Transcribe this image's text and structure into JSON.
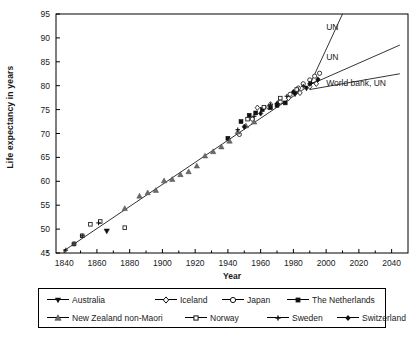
{
  "chart_data": {
    "type": "scatter",
    "title": "",
    "xlabel": "Year",
    "ylabel": "Life expectancy in years",
    "xlim": [
      1835,
      2050
    ],
    "ylim": [
      45,
      95
    ],
    "xticks": [
      1840,
      1860,
      1880,
      1900,
      1920,
      1940,
      1960,
      1980,
      2000,
      2020,
      2040
    ],
    "yticks": [
      45,
      50,
      55,
      60,
      65,
      70,
      75,
      80,
      85,
      90,
      95
    ],
    "grid": false,
    "legend_position": "below-axes",
    "trendline": {
      "label": "best-practice linear trend",
      "x": [
        1840,
        1996
      ],
      "y": [
        45.5,
        81.5
      ]
    },
    "annotations": [
      {
        "label": "UN",
        "x_text": 2000,
        "y_text": 92.2,
        "leader_from": [
          1990,
          80.2
        ],
        "leader_to": [
          2010,
          95.0
        ]
      },
      {
        "label": "UN",
        "x_text": 2000,
        "y_text": 86.0,
        "leader_from": [
          1990,
          80.2
        ],
        "leader_to": [
          2045,
          88.5
        ]
      },
      {
        "label": "World bank, UN",
        "x_text": 2000,
        "y_text": 80.5,
        "leader_from": [
          1990,
          79.2
        ],
        "leader_to": [
          2045,
          82.5
        ]
      }
    ],
    "series": [
      {
        "name": "Australia",
        "marker": "triangle-down",
        "fill": "#111111",
        "points": [
          [
            1866,
            49.6
          ],
          [
            1981,
            78.3
          ],
          [
            1988,
            79.5
          ]
        ]
      },
      {
        "name": "Iceland",
        "marker": "diamond-open",
        "fill": "#ffffff",
        "points": [
          [
            1958,
            75.4
          ],
          [
            1966,
            76.1
          ],
          [
            1971,
            76.5
          ],
          [
            1977,
            77.4
          ],
          [
            1984,
            78.5
          ],
          [
            1990,
            79.8
          ],
          [
            1994,
            80.4
          ]
        ]
      },
      {
        "name": "Japan",
        "marker": "circle-open",
        "fill": "#ffffff",
        "points": [
          [
            1947,
            69.8
          ],
          [
            1955,
            73.0
          ],
          [
            1965,
            75.5
          ],
          [
            1972,
            76.6
          ],
          [
            1978,
            78.2
          ],
          [
            1983,
            79.5
          ],
          [
            1986,
            80.4
          ],
          [
            1990,
            81.2
          ],
          [
            1993,
            82.0
          ],
          [
            1996,
            82.6
          ]
        ]
      },
      {
        "name": "The Netherlands",
        "marker": "square-filled",
        "fill": "#111111",
        "points": [
          [
            1940,
            69.0
          ],
          [
            1948,
            72.5
          ],
          [
            1953,
            73.8
          ],
          [
            1957,
            74.3
          ],
          [
            1961,
            75.0
          ],
          [
            1966,
            75.4
          ],
          [
            1970,
            75.9
          ],
          [
            1975,
            76.4
          ]
        ]
      },
      {
        "name": "New Zealand non-Maori",
        "marker": "triangle-up",
        "fill": "#6b6b6b",
        "points": [
          [
            1877,
            54.3
          ],
          [
            1886,
            56.9
          ],
          [
            1891,
            57.6
          ],
          [
            1896,
            58.1
          ],
          [
            1901,
            60.1
          ],
          [
            1906,
            60.4
          ],
          [
            1911,
            61.4
          ],
          [
            1916,
            62.0
          ],
          [
            1921,
            63.2
          ],
          [
            1926,
            65.3
          ],
          [
            1931,
            66.2
          ],
          [
            1936,
            67.2
          ],
          [
            1941,
            68.4
          ],
          [
            1946,
            70.3
          ],
          [
            1951,
            71.6
          ],
          [
            1956,
            72.4
          ]
        ]
      },
      {
        "name": "Norway",
        "marker": "square-open",
        "fill": "#ffffff",
        "points": [
          [
            1846,
            46.9
          ],
          [
            1851,
            48.6
          ],
          [
            1856,
            51.0
          ],
          [
            1862,
            51.6
          ],
          [
            1877,
            50.3
          ],
          [
            1952,
            73.0
          ],
          [
            1962,
            75.5
          ],
          [
            1972,
            77.4
          ],
          [
            1982,
            79.2
          ]
        ]
      },
      {
        "name": "Sweden",
        "marker": "cross",
        "fill": "#111111",
        "points": [
          [
            1841,
            45.6
          ],
          [
            1846,
            46.9
          ],
          [
            1851,
            48.6
          ],
          [
            1861,
            51.3
          ],
          [
            1946,
            70.8
          ],
          [
            1956,
            73.6
          ],
          [
            1966,
            76.0
          ],
          [
            1976,
            77.8
          ],
          [
            1986,
            79.9
          ],
          [
            1991,
            80.6
          ]
        ]
      },
      {
        "name": "Switzerland",
        "marker": "diamond-filled",
        "fill": "#111111",
        "points": [
          [
            1950,
            71.4
          ],
          [
            1960,
            74.2
          ],
          [
            1970,
            76.2
          ],
          [
            1980,
            78.7
          ],
          [
            1990,
            80.4
          ],
          [
            1995,
            81.3
          ]
        ]
      }
    ]
  },
  "axes": {
    "y_title": "Life expectancy in years",
    "x_title": "Year",
    "yticks": [
      "45",
      "50",
      "55",
      "60",
      "65",
      "70",
      "75",
      "80",
      "85",
      "90",
      "95"
    ],
    "xticks": [
      "1840",
      "1860",
      "1880",
      "1900",
      "1920",
      "1940",
      "1960",
      "1980",
      "2000",
      "2020",
      "2040"
    ]
  },
  "annotations": [
    {
      "text": "UN"
    },
    {
      "text": "UN"
    },
    {
      "text": "World bank, UN"
    }
  ],
  "legend": {
    "row1": [
      {
        "label": "Australia",
        "marker": "triangle-down"
      },
      {
        "label": "Iceland",
        "marker": "diamond-open"
      },
      {
        "label": "Japan",
        "marker": "circle-open"
      },
      {
        "label": "The Netherlands",
        "marker": "square-filled"
      }
    ],
    "row2": [
      {
        "label": "New Zealand non-Maori",
        "marker": "triangle-up"
      },
      {
        "label": "Norway",
        "marker": "square-open"
      },
      {
        "label": "Sweden",
        "marker": "cross"
      },
      {
        "label": "Switzerland",
        "marker": "diamond-filled"
      }
    ]
  },
  "colors": {
    "axis": "#000000",
    "marker_dark": "#111111",
    "marker_gray": "#6b6b6b",
    "marker_open": "#ffffff",
    "trend": "#333333"
  }
}
